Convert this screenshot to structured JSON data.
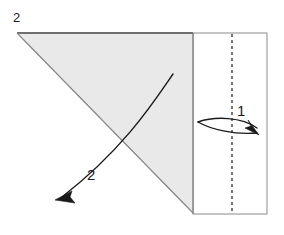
{
  "figure": {
    "type": "origami-fold-diagram",
    "caption_label": "2",
    "background_color": "#ffffff",
    "paper_fill": "#ffffff",
    "shaded_fill": "#e9e9e9",
    "outline_color": "#8a8a8a",
    "edge_color": "#6f6f6f",
    "fold_line_color": "#1a1a1a",
    "arrow_color": "#1a1a1a"
  },
  "shapes": {
    "rectangle_panel": {
      "name": "right-rectangle-panel",
      "x": 193,
      "y": 33,
      "width": 74,
      "height": 181,
      "fill": "#ffffff"
    },
    "shaded_triangle": {
      "name": "shaded-folded-triangle",
      "points": "17,33 193,33 193,213",
      "fill": "#e9e9e9"
    },
    "top_edge": {
      "name": "triangle-top-edge",
      "x1": 17,
      "y1": 33,
      "x2": 193,
      "y2": 33
    },
    "hypotenuse": {
      "name": "triangle-hypotenuse",
      "x1": 17,
      "y1": 33,
      "x2": 193,
      "y2": 213
    },
    "vertical_divider": {
      "name": "vertical-fold-divider",
      "x1": 193,
      "y1": 33,
      "x2": 193,
      "y2": 214
    },
    "dashed_fold_line": {
      "name": "dashed-valley-fold-line",
      "x": 232,
      "y1": 34,
      "y2": 213,
      "dash_pattern": "3,3"
    }
  },
  "annotations": {
    "figure_number": {
      "label": "2",
      "x": 13,
      "y": 22
    },
    "step_one": {
      "label": "1",
      "x": 237,
      "y": 116,
      "arrow_name": "fold-arrow-1",
      "direction": "right",
      "description": "valley fold arrow pointing right"
    },
    "step_two": {
      "label": "2",
      "x": 87,
      "y": 180,
      "arrow_name": "fold-arrow-2",
      "direction": "down-left",
      "description": "unfold arrow pointing down-left"
    }
  },
  "arrows": {
    "arrow_one": {
      "upper_path": "M 198,122 C 215,116 242,117 257,128",
      "lower_path": "M 198,122 C 210,129 234,135 257,133",
      "head_points": "259,135 245,128 251,126 248,120",
      "head_tip_x": 259,
      "head_tip_y": 135
    },
    "arrow_two": {
      "path": "M 173,74 C 155,100 125,148 62,197",
      "head_points": "55,200 72,191 70,197 75,203",
      "head_tip_x": 55,
      "head_tip_y": 200
    }
  }
}
